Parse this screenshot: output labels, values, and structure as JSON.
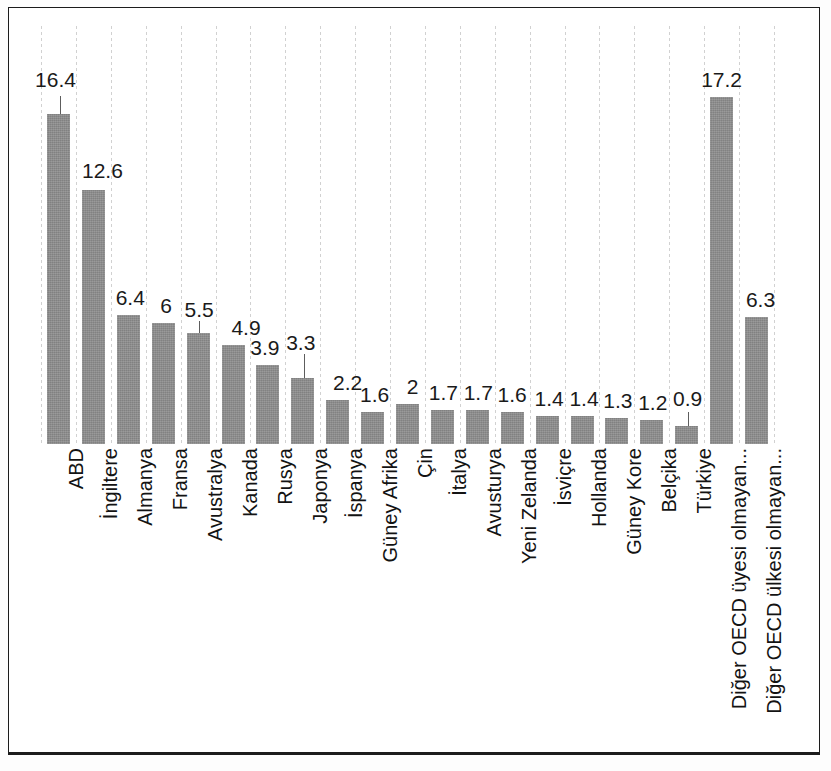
{
  "chart_data": {
    "type": "bar",
    "title": "",
    "subtitle": "",
    "xlabel": "",
    "ylabel": "",
    "ylim": [
      0,
      18
    ],
    "grid": "vertical-dotted-category-separators",
    "legend": "none",
    "bar_color": "#8e8e8e",
    "categories": [
      "ABD",
      "İngiltere",
      "Almanya",
      "Fransa",
      "Avustralya",
      "Kanada",
      "Rusya",
      "Japonya",
      "İspanya",
      "Güney Afrika",
      "Çin",
      "İtalya",
      "Avusturya",
      "Yeni Zelanda",
      "İsviçre",
      "Hollanda",
      "Güney Kore",
      "Belçika",
      "Türkiye",
      "Diğer OECD üyesi olmayan...",
      "Diğer OECD ülkesi olmayan..."
    ],
    "values": [
      16.4,
      12.6,
      6.4,
      6,
      5.5,
      4.9,
      3.9,
      3.3,
      2.2,
      1.6,
      2,
      1.7,
      1.7,
      1.6,
      1.4,
      1.4,
      1.3,
      1.2,
      0.9,
      17.2,
      6.3
    ],
    "value_labels": [
      "16.4",
      "12.6",
      "6.4",
      "6",
      "5.5",
      "4.9",
      "3.9",
      "3.3",
      "2.2",
      "1.6",
      "2",
      "1.7",
      "1.7",
      "1.6",
      "1.4",
      "1.4",
      "1.3",
      "1.2",
      "0.9",
      "17.2",
      "6.3"
    ],
    "labels_with_leader_lines": [
      "16.4",
      "3.3",
      "4.9",
      "0.9"
    ]
  },
  "chart": {
    "value_label_offsets_px": [
      {
        "dx": -3,
        "dy": -45,
        "leader": 18
      },
      {
        "dx": 9,
        "dy": -30,
        "leader": 0
      },
      {
        "dx": 2,
        "dy": -28,
        "leader": 0
      },
      {
        "dx": 3,
        "dy": -28,
        "leader": 0
      },
      {
        "dx": 1,
        "dy": -34,
        "leader": 12
      },
      {
        "dx": 13,
        "dy": -28,
        "leader": 0
      },
      {
        "dx": -3,
        "dy": -28,
        "leader": 0
      },
      {
        "dx": -2,
        "dy": -46,
        "leader": 24
      },
      {
        "dx": 10,
        "dy": -28,
        "leader": 0
      },
      {
        "dx": 2,
        "dy": -28,
        "leader": 0
      },
      {
        "dx": 5,
        "dy": -28,
        "leader": 0
      },
      {
        "dx": 1,
        "dy": -28,
        "leader": 0
      },
      {
        "dx": 1,
        "dy": -28,
        "leader": 0
      },
      {
        "dx": 0,
        "dy": -28,
        "leader": 0
      },
      {
        "dx": 2,
        "dy": -28,
        "leader": 0
      },
      {
        "dx": 2,
        "dy": -28,
        "leader": 0
      },
      {
        "dx": 1,
        "dy": -28,
        "leader": 0
      },
      {
        "dx": 1,
        "dy": -28,
        "leader": 0
      },
      {
        "dx": 1,
        "dy": -38,
        "leader": 14
      },
      {
        "dx": 0,
        "dy": -28,
        "leader": 0
      },
      {
        "dx": 4,
        "dy": -28,
        "leader": 0
      }
    ]
  }
}
